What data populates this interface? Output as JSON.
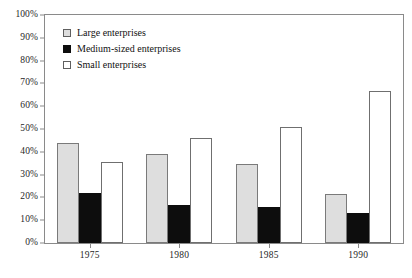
{
  "chart_data": {
    "type": "bar",
    "title": "",
    "subtitle": "",
    "xlabel": "",
    "ylabel": "",
    "categories": [
      "1975",
      "1980",
      "1985",
      "1990"
    ],
    "series": [
      {
        "name": "Large enterprises",
        "color": "#dedede",
        "values": [
          44,
          39,
          34.5,
          21.5
        ]
      },
      {
        "name": "Medium-sized enterprises",
        "color": "#0d0d0d",
        "values": [
          22,
          16.5,
          16,
          13
        ]
      },
      {
        "name": "Small enterprises",
        "color": "#ffffff",
        "values": [
          35.5,
          46,
          51,
          66.5
        ]
      }
    ],
    "ylim": [
      0,
      100
    ],
    "ytick_values": [
      0,
      10,
      20,
      30,
      40,
      50,
      60,
      70,
      80,
      90,
      100
    ],
    "ytick_labels": [
      "0%",
      "10%",
      "20%",
      "30%",
      "40%",
      "50%",
      "60%",
      "70%",
      "80%",
      "90%",
      "100%"
    ],
    "grid": false,
    "legend_position": "top-left",
    "legend": [
      "Large enterprises",
      "Medium-sized enterprises",
      "Small enterprises"
    ]
  },
  "legend": {
    "items": [
      {
        "label": "Large enterprises",
        "swatch": "square-gray-icon"
      },
      {
        "label": "Medium-sized enterprises",
        "swatch": "square-black-icon"
      },
      {
        "label": "Small enterprises",
        "swatch": "square-white-icon"
      }
    ]
  }
}
